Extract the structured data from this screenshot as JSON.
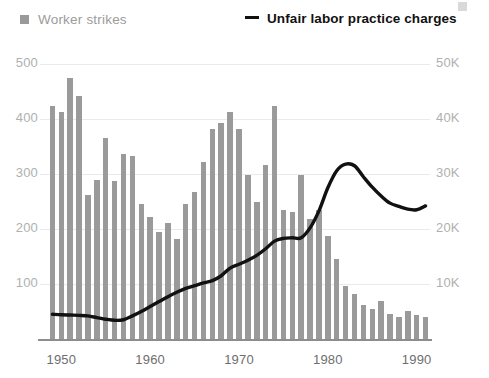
{
  "legend": {
    "bars": {
      "label": "Worker strikes",
      "icon": "square-swatch-icon",
      "color": "#9a9a9a"
    },
    "line": {
      "label": "Unfair labor practice charges",
      "icon": "line-swatch-icon",
      "color": "#111111"
    }
  },
  "axes": {
    "left_ticks": [
      "500",
      "400",
      "300",
      "200",
      "100"
    ],
    "right_ticks": [
      "50K",
      "40K",
      "30K",
      "20K",
      "10K"
    ],
    "x_ticks": [
      "1950",
      "1960",
      "1970",
      "1980",
      "1990"
    ]
  },
  "chart_data": {
    "type": "bar",
    "title": "",
    "subtitle": "",
    "xlabel": "",
    "ylabel": "Worker strikes",
    "y2label": "Unfair labor practice charges",
    "grid": true,
    "legend_position": "top",
    "xlim": [
      1948.5,
      1991.5
    ],
    "ylim": [
      0,
      500
    ],
    "y2lim": [
      0,
      50000
    ],
    "x": [
      1949,
      1950,
      1951,
      1952,
      1953,
      1954,
      1955,
      1956,
      1957,
      1958,
      1959,
      1960,
      1961,
      1962,
      1963,
      1964,
      1965,
      1966,
      1967,
      1968,
      1969,
      1970,
      1971,
      1972,
      1973,
      1974,
      1975,
      1976,
      1977,
      1978,
      1979,
      1980,
      1981,
      1982,
      1983,
      1984,
      1985,
      1986,
      1987,
      1988,
      1989,
      1990,
      1991
    ],
    "series": [
      {
        "name": "Worker strikes",
        "axis": "left",
        "type": "bar",
        "color": "#9a9a9a",
        "values": [
          424,
          412,
          474,
          442,
          262,
          289,
          366,
          287,
          337,
          332,
          245,
          222,
          195,
          211,
          181,
          246,
          268,
          321,
          381,
          392,
          412,
          381,
          298,
          250,
          317,
          424,
          235,
          231,
          298,
          219,
          235,
          187,
          145,
          96,
          81,
          62,
          54,
          69,
          46,
          40,
          51,
          44,
          40
        ]
      },
      {
        "name": "Unfair labor practice charges",
        "axis": "right",
        "type": "line",
        "color": "#111111",
        "values": [
          4500,
          4400,
          4350,
          4300,
          4200,
          3900,
          3600,
          3400,
          3500,
          4200,
          5000,
          5900,
          6800,
          7700,
          8500,
          9200,
          9700,
          10200,
          10600,
          11500,
          12900,
          13600,
          14300,
          15200,
          16400,
          17800,
          18300,
          18400,
          18400,
          20200,
          23300,
          27500,
          30600,
          31800,
          31500,
          29500,
          27600,
          26000,
          24700,
          24100,
          23600,
          23500,
          24200
        ]
      }
    ]
  }
}
